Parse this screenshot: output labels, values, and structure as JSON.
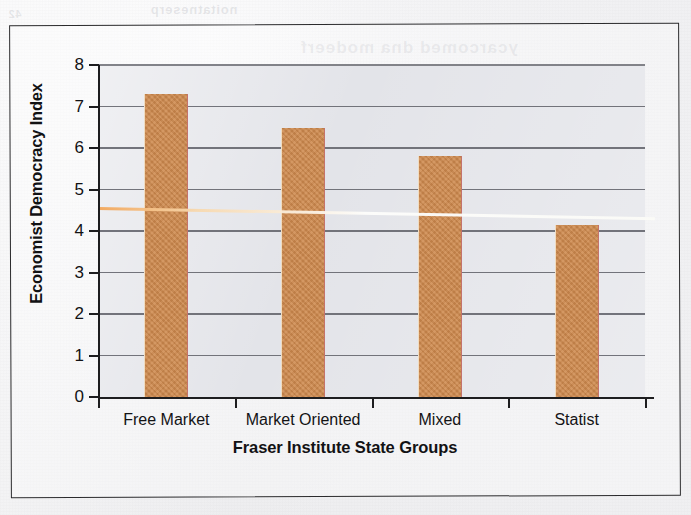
{
  "figure": {
    "frame_border_color": "#2b2b2d",
    "page_background": "#eeeef0"
  },
  "bleedthrough": {
    "line_top": "noitatneserp",
    "line_under": "ycarcomed dna modeerf",
    "line_left": "42"
  },
  "chart_data": {
    "type": "bar",
    "title": "",
    "xlabel": "Fraser Institute State Groups",
    "ylabel": "Economist Democracy Index",
    "categories": [
      "Free Market",
      "Market Oriented",
      "Mixed",
      "Statist"
    ],
    "values": [
      7.29,
      6.48,
      5.8,
      4.14
    ],
    "ylim": [
      0,
      8
    ],
    "yticks": [
      0,
      1,
      2,
      3,
      4,
      5,
      6,
      7,
      8
    ],
    "ytick_labels": [
      "0",
      "1",
      "2",
      "3",
      "4",
      "5",
      "6",
      "7",
      "8"
    ],
    "grid": true,
    "grid_axis": "y",
    "legend": false,
    "legend_position": "none",
    "bar_color": "#cf8a4e",
    "bar_edge_color": "#c4736b",
    "plot_background": "#e3e4e9",
    "gridline_color": "#6c6d74",
    "axis_color": "#1d1d1f",
    "annotations": [
      {
        "name": "trend-line",
        "type": "line",
        "color": "#fdfdfb",
        "x_start": "Free Market",
        "x_end": "Statist",
        "y_start": 5.0,
        "y_end": 4.78,
        "description": "downward sloping linear trend line"
      }
    ]
  }
}
